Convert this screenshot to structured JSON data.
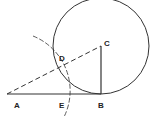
{
  "diagram": {
    "colors": {
      "stroke": "#333333",
      "background": "#ffffff"
    },
    "points": {
      "A": {
        "label": "A",
        "x": 7,
        "y": 94
      },
      "B": {
        "label": "B",
        "x": 101,
        "y": 94
      },
      "C": {
        "label": "C",
        "x": 101,
        "y": 46
      },
      "D": {
        "label": "D",
        "x": 62,
        "y": 65
      },
      "E": {
        "label": "E",
        "x": 66,
        "y": 94
      }
    },
    "circle": {
      "center": "C",
      "radius": 48
    },
    "arc": {
      "center": "A",
      "radius": 59,
      "style": "dashed"
    },
    "segments": [
      {
        "from": "A",
        "to": "B",
        "style": "solid"
      },
      {
        "from": "B",
        "to": "C",
        "style": "solid"
      },
      {
        "from": "A",
        "to": "C",
        "style": "dashed"
      }
    ]
  }
}
